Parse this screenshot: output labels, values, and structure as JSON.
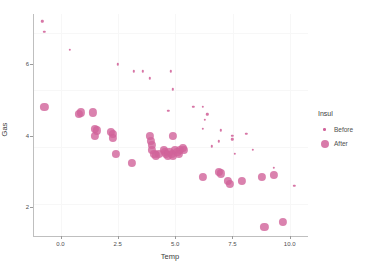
{
  "chart_data": {
    "type": "scatter",
    "title": "",
    "xlabel": "Temp",
    "ylabel": "Gas",
    "xlim": [
      -1.2,
      10.8
    ],
    "ylim": [
      1.2,
      7.4
    ],
    "xticks": [
      "0.0",
      "2.5",
      "5.0",
      "7.5",
      "10.0"
    ],
    "xtick_values": [
      0.0,
      2.5,
      5.0,
      7.5,
      10.0
    ],
    "yticks": [
      "2",
      "4",
      "6"
    ],
    "ytick_values": [
      2,
      4,
      6
    ],
    "grid": true,
    "legend": {
      "title": "Insul",
      "position": "right",
      "entries": [
        {
          "label": "Before",
          "size": "small",
          "color": "#d1639a"
        },
        {
          "label": "After",
          "size": "large",
          "color": "#d1639a"
        }
      ]
    },
    "series": [
      {
        "name": "Before",
        "color": "#d1639a",
        "marker_size": 2.4,
        "points": [
          [
            -0.8,
            7.2
          ],
          [
            -0.7,
            6.9
          ],
          [
            0.4,
            6.4
          ],
          [
            2.5,
            6.0
          ],
          [
            3.2,
            5.8
          ],
          [
            3.6,
            5.8
          ],
          [
            4.8,
            5.8
          ],
          [
            3.9,
            5.6
          ],
          [
            4.9,
            5.3
          ],
          [
            4.7,
            4.7
          ],
          [
            5.8,
            4.8
          ],
          [
            6.2,
            4.8
          ],
          [
            6.4,
            4.6
          ],
          [
            6.3,
            4.45
          ],
          [
            6.2,
            4.2
          ],
          [
            7.0,
            4.15
          ],
          [
            7.5,
            4.0
          ],
          [
            8.1,
            4.05
          ],
          [
            6.9,
            3.85
          ],
          [
            7.5,
            3.9
          ],
          [
            6.6,
            3.7
          ],
          [
            7.6,
            3.5
          ],
          [
            8.4,
            3.6
          ],
          [
            9.3,
            3.1
          ],
          [
            10.2,
            2.6
          ]
        ]
      },
      {
        "name": "After",
        "color": "#d1639a",
        "marker_size": 8.2,
        "points": [
          [
            -0.7,
            4.8
          ],
          [
            0.8,
            4.6
          ],
          [
            0.9,
            4.65
          ],
          [
            1.4,
            4.65
          ],
          [
            1.5,
            4.2
          ],
          [
            1.6,
            4.15
          ],
          [
            1.5,
            4.0
          ],
          [
            2.2,
            4.1
          ],
          [
            2.3,
            4.05
          ],
          [
            2.3,
            3.95
          ],
          [
            2.4,
            3.5
          ],
          [
            3.1,
            3.25
          ],
          [
            3.9,
            4.0
          ],
          [
            3.95,
            3.85
          ],
          [
            4.0,
            3.75
          ],
          [
            4.0,
            3.6
          ],
          [
            4.1,
            3.5
          ],
          [
            4.15,
            3.45
          ],
          [
            4.3,
            3.5
          ],
          [
            4.5,
            3.6
          ],
          [
            4.55,
            3.55
          ],
          [
            4.6,
            3.5
          ],
          [
            4.7,
            3.45
          ],
          [
            4.75,
            3.55
          ],
          [
            4.85,
            3.5
          ],
          [
            4.9,
            3.45
          ],
          [
            4.9,
            4.0
          ],
          [
            5.0,
            3.6
          ],
          [
            5.1,
            3.55
          ],
          [
            5.15,
            3.5
          ],
          [
            5.2,
            3.6
          ],
          [
            5.35,
            3.65
          ],
          [
            5.4,
            3.6
          ],
          [
            6.2,
            2.85
          ],
          [
            6.9,
            3.0
          ],
          [
            7.0,
            2.95
          ],
          [
            7.3,
            2.75
          ],
          [
            7.4,
            2.65
          ],
          [
            7.9,
            2.75
          ],
          [
            8.8,
            2.85
          ],
          [
            9.3,
            2.9
          ],
          [
            8.9,
            1.45
          ],
          [
            9.7,
            1.6
          ]
        ]
      }
    ]
  }
}
